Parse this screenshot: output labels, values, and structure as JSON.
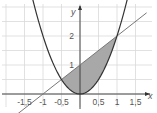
{
  "chart_data": {
    "type": "line",
    "title": "",
    "xlabel": "x",
    "ylabel": "y",
    "x_ticks": [
      "-1,5",
      "-1",
      "-0,5",
      "0,5",
      "1",
      "1,5"
    ],
    "x_tick_values": [
      -1.5,
      -1,
      -0.5,
      0.5,
      1,
      1.5
    ],
    "y_ticks": [
      "1",
      "2"
    ],
    "y_tick_values": [
      1,
      2
    ],
    "xlim": [
      -2.1,
      2.1
    ],
    "ylim": [
      -0.6,
      3.2
    ],
    "grid": true,
    "series": [
      {
        "name": "parabola",
        "expression": "y = 2x^2",
        "color": "#333333"
      },
      {
        "name": "line",
        "expression": "y = x + 1",
        "color": "#777777"
      }
    ],
    "shaded_region": {
      "between": [
        "y = x + 1",
        "y = 2x^2"
      ],
      "x_from": -0.5,
      "x_to": 1,
      "color": "#a8a8a8"
    },
    "intersections": [
      {
        "x": -0.5,
        "y": 0.5
      },
      {
        "x": 1,
        "y": 2
      }
    ]
  },
  "labels": {
    "x_axis": "x",
    "y_axis": "y"
  }
}
